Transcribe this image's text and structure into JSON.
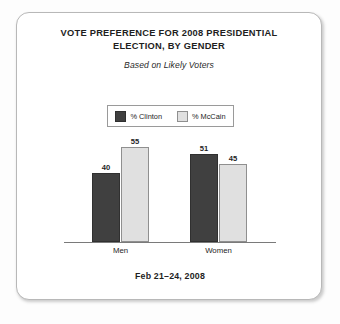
{
  "card": {
    "background": "#ffffff",
    "border_color": "#b8b8b8"
  },
  "header": {
    "title": "VOTE PREFERENCE FOR 2008 PRESIDENTIAL ELECTION, BY GENDER",
    "subtitle": "Based on Likely Voters"
  },
  "footer": {
    "date_range": "Feb 21–24, 2008"
  },
  "chart_data": {
    "type": "bar",
    "title": "VOTE PREFERENCE FOR 2008 PRESIDENTIAL ELECTION, BY GENDER",
    "subtitle": "Based on Likely Voters",
    "xlabel": "",
    "ylabel": "",
    "ylim": [
      0,
      60
    ],
    "grid": false,
    "legend_position": "top-center",
    "annotation": "Feb 21–24, 2008",
    "data_labels": true,
    "categories": [
      "Men",
      "Women"
    ],
    "series": [
      {
        "name": "% Clinton",
        "color": "#404040",
        "border_color": "#303030",
        "values": [
          40,
          45
        ]
      },
      {
        "name": "% McCain",
        "color": "#e0e0e0",
        "border_color": "#8f8f8f",
        "values": [
          55,
          45
        ]
      }
    ],
    "points": [
      {
        "category": "Men",
        "series": "% Clinton",
        "value": 40
      },
      {
        "category": "Men",
        "series": "% McCain",
        "value": 55
      },
      {
        "category": "Women",
        "series": "% Clinton",
        "value": 51
      },
      {
        "category": "Women",
        "series": "% McCain",
        "value": 45
      }
    ]
  }
}
